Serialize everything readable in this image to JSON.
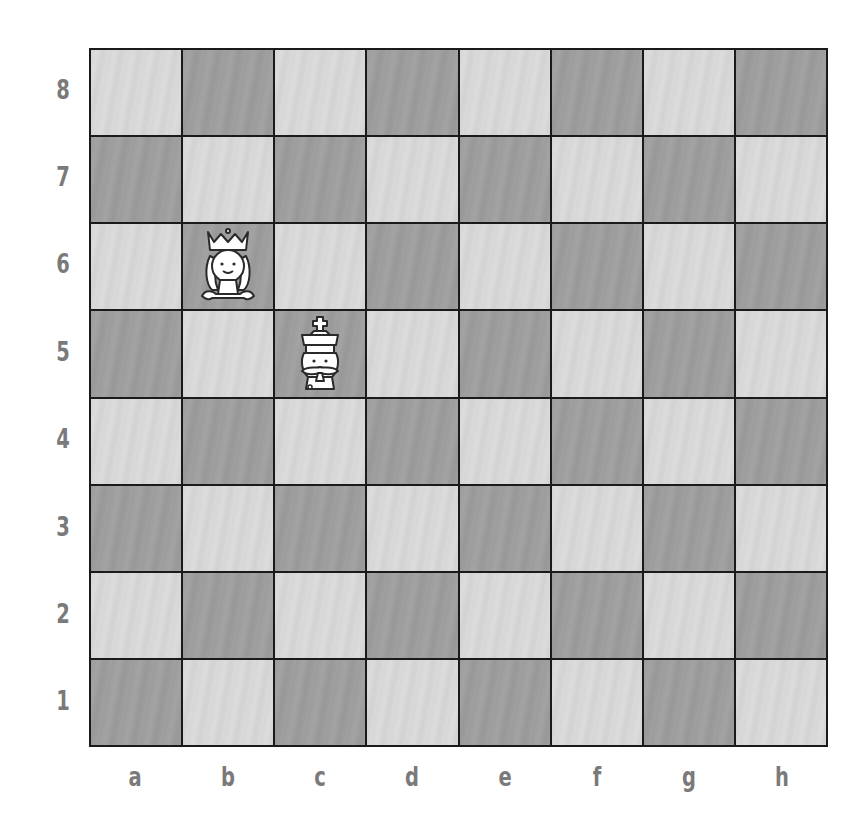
{
  "board": {
    "files": [
      "a",
      "b",
      "c",
      "d",
      "e",
      "f",
      "g",
      "h"
    ],
    "ranks": [
      "8",
      "7",
      "6",
      "5",
      "4",
      "3",
      "2",
      "1"
    ],
    "orientation": "white-bottom",
    "colors": {
      "light_square": "#d6d6d6",
      "dark_square": "#9e9e9e",
      "grid_line": "#1a1a1a",
      "label": "#7a7a7a"
    },
    "pieces": [
      {
        "square": "b6",
        "type": "queen",
        "color": "white",
        "icon": "cartoon-queen-icon"
      },
      {
        "square": "c5",
        "type": "king",
        "color": "white",
        "icon": "cartoon-king-icon"
      }
    ]
  }
}
